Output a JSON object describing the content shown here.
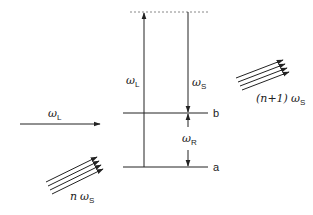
{
  "diagram": {
    "type": "energy-level / stimulated Raman scattering",
    "levels": [
      {
        "id": "virtual",
        "label": "",
        "style": "dotted"
      },
      {
        "id": "b",
        "label": "b"
      },
      {
        "id": "a",
        "label": "a"
      }
    ],
    "transitions": {
      "pump": {
        "symbol": "ω",
        "sub": "L",
        "direction": "up"
      },
      "stokes": {
        "symbol": "ω",
        "sub": "S",
        "direction": "down"
      },
      "raman": {
        "symbol": "ω",
        "sub": "R"
      }
    },
    "beams": {
      "incident_laser": {
        "symbol": "ω",
        "sub": "L"
      },
      "incident_stokes": {
        "prefix": "n",
        "symbol": "ω",
        "sub": "S"
      },
      "outgoing_stokes": {
        "prefix": "(n+1)",
        "symbol": "ω",
        "sub": "S"
      }
    },
    "colors": {
      "ink": "#222222",
      "dotted": "#888888"
    }
  }
}
